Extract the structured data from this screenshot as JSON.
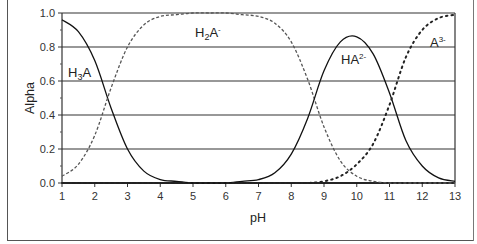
{
  "chart_data": {
    "type": "line",
    "title": "",
    "xlabel": "pH",
    "ylabel": "Alpha",
    "xlim": [
      1,
      13
    ],
    "ylim": [
      0.0,
      1.0
    ],
    "x_ticks": [
      "1",
      "2",
      "3",
      "4",
      "5",
      "6",
      "7",
      "8",
      "9",
      "10",
      "11",
      "12",
      "13"
    ],
    "y_ticks": [
      "0.0",
      "0.2",
      "0.4",
      "0.6",
      "0.8",
      "1.0"
    ],
    "grid": {
      "horizontal": true,
      "vertical": false
    },
    "legend": "none (inline species labels)",
    "pKa": [
      2.4,
      8.7,
      11.1
    ],
    "x": [
      1.0,
      1.5,
      2.0,
      2.5,
      3.0,
      3.5,
      4.0,
      4.5,
      5.0,
      5.5,
      6.0,
      6.5,
      7.0,
      7.5,
      8.0,
      8.5,
      9.0,
      9.5,
      10.0,
      10.5,
      11.0,
      11.5,
      12.0,
      12.5,
      13.0
    ],
    "series": [
      {
        "name": "H3A",
        "label": "H₃A",
        "style": "solid",
        "values": [
          0.96,
          0.89,
          0.72,
          0.44,
          0.2,
          0.07,
          0.02,
          0.01,
          0.0,
          0.0,
          0.0,
          0.0,
          0.0,
          0.0,
          0.0,
          0.0,
          0.0,
          0.0,
          0.0,
          0.0,
          0.0,
          0.0,
          0.0,
          0.0,
          0.0
        ]
      },
      {
        "name": "H2A-",
        "label": "H₂A⁻",
        "style": "dotted-dashed light",
        "values": [
          0.04,
          0.11,
          0.28,
          0.56,
          0.8,
          0.93,
          0.98,
          0.99,
          1.0,
          1.0,
          1.0,
          0.99,
          0.98,
          0.94,
          0.83,
          0.61,
          0.33,
          0.13,
          0.04,
          0.01,
          0.0,
          0.0,
          0.0,
          0.0,
          0.0
        ]
      },
      {
        "name": "HA2-",
        "label": "HA²⁻",
        "style": "solid",
        "values": [
          0.0,
          0.0,
          0.0,
          0.0,
          0.0,
          0.0,
          0.0,
          0.0,
          0.0,
          0.0,
          0.0,
          0.01,
          0.02,
          0.06,
          0.17,
          0.38,
          0.66,
          0.83,
          0.86,
          0.76,
          0.53,
          0.25,
          0.1,
          0.03,
          0.01
        ]
      },
      {
        "name": "A3-",
        "label": "A³⁻",
        "style": "dotted bold",
        "values": [
          0.0,
          0.0,
          0.0,
          0.0,
          0.0,
          0.0,
          0.0,
          0.0,
          0.0,
          0.0,
          0.0,
          0.0,
          0.0,
          0.0,
          0.0,
          0.0,
          0.01,
          0.04,
          0.11,
          0.23,
          0.46,
          0.74,
          0.9,
          0.97,
          0.99
        ]
      }
    ],
    "annotations": [
      {
        "text": "H₃A",
        "x": 1.5,
        "y": 0.6
      },
      {
        "text": "H₂A⁻",
        "x": 5.4,
        "y": 0.87
      },
      {
        "text": "HA²⁻",
        "x": 9.9,
        "y": 0.69
      },
      {
        "text": "A³⁻",
        "x": 12.2,
        "y": 0.8
      }
    ]
  },
  "labels": {
    "xlabel": "pH",
    "ylabel": "Alpha",
    "h3a_base": "H",
    "h3a_sub": "3",
    "h3a_tail": "A",
    "h2a_base": "H",
    "h2a_sub": "2",
    "h2a_tail": "A",
    "h2a_sup": "-",
    "ha2_base": "HA",
    "ha2_sup": "2-",
    "a3_base": "A",
    "a3_sup": "3-"
  }
}
